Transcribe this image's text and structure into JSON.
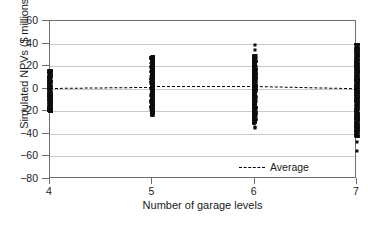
{
  "chart_data": {
    "type": "scatter",
    "title": "",
    "xlabel": "Number of garage levels",
    "ylabel": "Simulated NPVs ($ millions)",
    "xlim": [
      4,
      7
    ],
    "ylim": [
      -80,
      60
    ],
    "xticks": [
      4,
      5,
      6,
      7
    ],
    "xtick_labels": [
      "4",
      "5",
      "6",
      "7"
    ],
    "yticks": [
      60,
      40,
      20,
      0,
      -20,
      -40,
      -60,
      -80
    ],
    "ytick_labels": [
      "60",
      "40",
      "20",
      "0",
      "−20",
      "−40",
      "−60",
      "−80"
    ],
    "grid": "horizontal",
    "legend_position": "inside bottom-right",
    "series": [
      {
        "name": "Simulated NPVs",
        "marker": "dot",
        "color": "#0d0d0d",
        "groups": [
          {
            "x": 4,
            "y_min": -21,
            "y_max": 17,
            "density": "dense",
            "outliers": []
          },
          {
            "x": 5,
            "y_min": -24,
            "y_max": 29,
            "density": "dense",
            "outliers": []
          },
          {
            "x": 6,
            "y_min": -31,
            "y_max": 30,
            "density": "dense",
            "outliers": [
              39,
              34,
              -34,
              -35
            ]
          },
          {
            "x": 7,
            "y_min": -43,
            "y_max": 40,
            "density": "dense",
            "outliers": [
              -47,
              -55
            ]
          }
        ]
      },
      {
        "name": "Average",
        "marker": "dashed-line",
        "color": "#000000",
        "points": [
          {
            "x": 4,
            "y": 1
          },
          {
            "x": 5,
            "y": 2
          },
          {
            "x": 6,
            "y": 2
          },
          {
            "x": 7,
            "y": 0
          }
        ]
      }
    ]
  },
  "legend": {
    "entries": [
      {
        "label": "Average",
        "style": "dashed",
        "color": "#000000"
      }
    ]
  },
  "colors": {
    "data": "#0d0d0d",
    "average": "#000000",
    "grid": "#c9c9c9",
    "axis": "#6e6e6e",
    "text": "#1a1a1a",
    "background": "#ffffff"
  }
}
